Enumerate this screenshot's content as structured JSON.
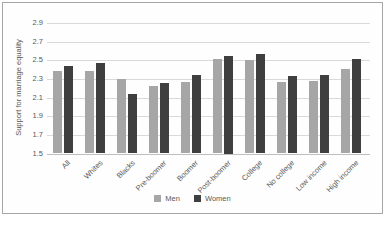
{
  "chart_data": {
    "type": "bar",
    "title": "",
    "xlabel": "",
    "ylabel": "Support for marriage equality",
    "ylim": [
      1.5,
      2.9
    ],
    "ytick_step": 0.2,
    "yticks": [
      "1.5",
      "1.7",
      "1.9",
      "2.1",
      "2.3",
      "2.5",
      "2.7",
      "2.9"
    ],
    "grid": true,
    "legend_position": "bottom",
    "categories": [
      "All",
      "Whites",
      "Blacks",
      "Pre-boomer",
      "Boomer",
      "Post-boomer",
      "College",
      "No college",
      "Low income",
      "High income"
    ],
    "series": [
      {
        "name": "Men",
        "color": "#a6a6a6",
        "values": [
          2.38,
          2.39,
          2.3,
          2.22,
          2.27,
          2.51,
          2.5,
          2.27,
          2.28,
          2.41
        ]
      },
      {
        "name": "Women",
        "color": "#3f3f3f",
        "values": [
          2.44,
          2.47,
          2.14,
          2.26,
          2.34,
          2.55,
          2.57,
          2.33,
          2.34,
          2.51
        ]
      }
    ],
    "colors": {
      "gridline": "#d9d9d9",
      "baseline": "#bfbfbf",
      "text": "#595959",
      "frame_border": "#a6a6a6",
      "background": "#ffffff"
    }
  }
}
